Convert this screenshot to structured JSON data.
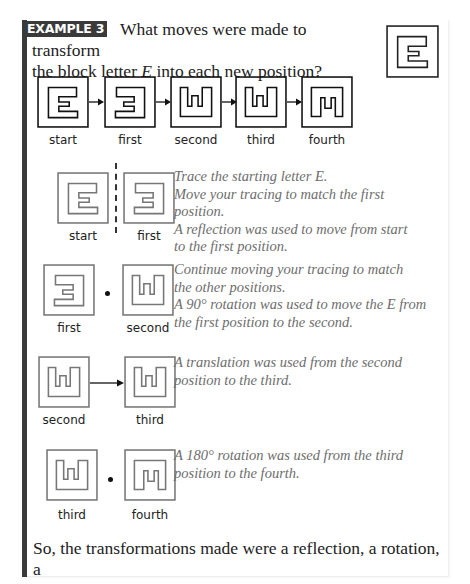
{
  "header": {
    "badge": "EXAMPLE 3",
    "question_part1": "What moves were made to transform",
    "question_part2a": "the block letter ",
    "question_letter": "E",
    "question_part2b": " into each new position?"
  },
  "reference_glyph": {
    "letter": "E",
    "orientation": "start"
  },
  "sequence": {
    "positions": [
      {
        "label": "start",
        "shape": "E-normal"
      },
      {
        "label": "first",
        "shape": "E-reflected"
      },
      {
        "label": "second",
        "shape": "E-rotated-90"
      },
      {
        "label": "third",
        "shape": "E-rotated-90"
      },
      {
        "label": "fourth",
        "shape": "E-rotated-270"
      }
    ],
    "connector": "arrow-right-icon"
  },
  "steps": [
    {
      "from_label": "start",
      "to_label": "first",
      "separator": "dashed-mirror-line",
      "lines": [
        "Trace the starting letter E.",
        "Move your tracing to match the first",
        "position.",
        "A reflection was used to move from start",
        "to the first position."
      ]
    },
    {
      "from_label": "first",
      "to_label": "second",
      "separator": "rotation-center-dot",
      "lines": [
        "Continue moving your tracing to match",
        "the other positions.",
        "A 90° rotation was used to move the E from",
        "the first position to the second."
      ]
    },
    {
      "from_label": "second",
      "to_label": "third",
      "separator": "translation-arrow",
      "lines": [
        "A translation was used from the second",
        "position to the third."
      ]
    },
    {
      "from_label": "third",
      "to_label": "fourth",
      "separator": "rotation-center-dot",
      "lines": [
        "A 180° rotation was used from the third",
        "position to the fourth."
      ]
    }
  ],
  "conclusion": {
    "line1": "So, the transformations made were a reflection, a rotation, a",
    "line2": "translation, and a rotation."
  },
  "colors": {
    "accent_bar": "#3a3a3a",
    "badge_text": "#ffffff",
    "body_text": "#222222",
    "explanation_text": "#6d6d6d"
  }
}
